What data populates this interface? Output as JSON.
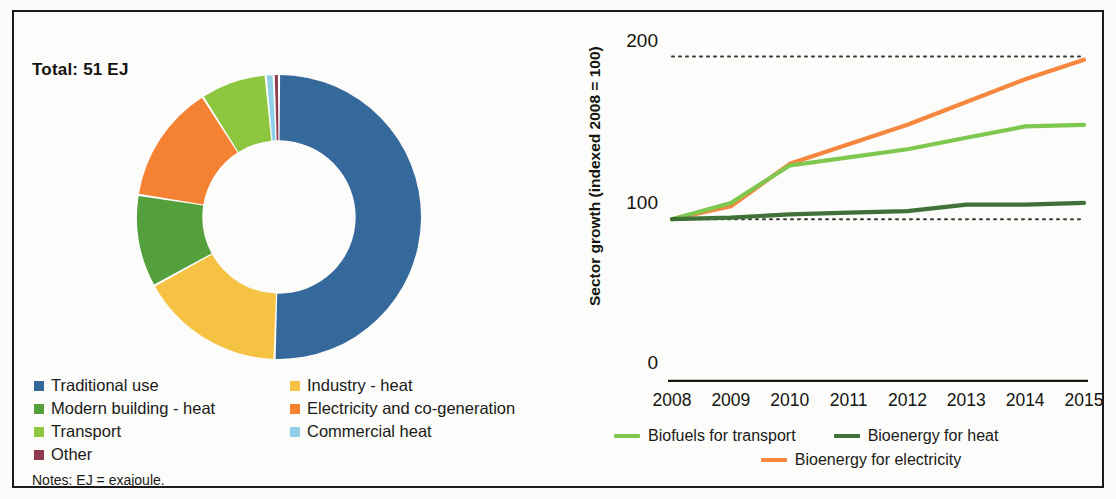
{
  "figure": {
    "notes": "Notes: EJ = exajoule."
  },
  "pie_panel": {
    "total_label": "Total: 51 EJ",
    "legend_left": [
      {
        "label": "Traditional use",
        "color": "#36699b"
      },
      {
        "label": "Modern building - heat",
        "color": "#53a03c"
      },
      {
        "label": "Transport",
        "color": "#8dc63f"
      },
      {
        "label": "Other",
        "color": "#8f3a4e"
      }
    ],
    "legend_right": [
      {
        "label": "Industry - heat",
        "color": "#f6c244"
      },
      {
        "label": "Electricity and co-generation",
        "color": "#f58232"
      },
      {
        "label": "Commercial heat",
        "color": "#8fd0e8"
      }
    ]
  },
  "line_panel": {
    "ylabel": "Sector growth (indexed 2008 = 100)",
    "yticks": [
      "200",
      "100",
      "0"
    ],
    "legend": [
      {
        "label": "Biofuels for transport",
        "color": "#7ec850"
      },
      {
        "label": "Bioenergy for heat",
        "color": "#3f7138"
      },
      {
        "label": "Bioenergy for electricity",
        "color": "#f5873f"
      }
    ]
  },
  "chart_data": [
    {
      "type": "pie",
      "title": "Total: 51 EJ",
      "subtitle": "Bioenergy final energy consumption by sector",
      "total": 51,
      "total_unit": "EJ",
      "legend_position": "bottom",
      "labels": [
        "Traditional use",
        "Industry - heat",
        "Modern building - heat",
        "Electricity and co-generation",
        "Transport",
        "Commercial heat",
        "Other"
      ],
      "values": [
        50.5,
        16.5,
        10.5,
        13.5,
        7.5,
        0.9,
        0.6
      ],
      "value_unit": "percent of total",
      "colors": [
        "#36699b",
        "#f6c244",
        "#53a03c",
        "#f58232",
        "#8dc63f",
        "#8fd0e8",
        "#8f3a4e"
      ],
      "donut": true,
      "inner_radius_fraction": 0.54,
      "start_angle_deg": 0,
      "direction": "clockwise"
    },
    {
      "type": "line",
      "title": "",
      "xlabel": "",
      "ylabel": "Sector growth (indexed 2008 = 100)",
      "x": [
        2008,
        2009,
        2010,
        2011,
        2012,
        2013,
        2014,
        2015
      ],
      "xtick_labels": [
        "2008",
        "2009",
        "2010",
        "2011",
        "2012",
        "2013",
        "2014",
        "2015"
      ],
      "ylim": [
        0,
        215
      ],
      "ytick_values": [
        0,
        100,
        200
      ],
      "ytick_labels": [
        "0",
        "100",
        "200"
      ],
      "grid": "dotted horizontal gridlines at 100 and 200",
      "legend_position": "below axis",
      "series": [
        {
          "name": "Biofuels for transport",
          "color": "#7ec850",
          "values": [
            100,
            110,
            133,
            138,
            143,
            150,
            157,
            158
          ]
        },
        {
          "name": "Bioenergy for heat",
          "color": "#3f7138",
          "values": [
            100,
            101,
            103,
            104,
            105,
            109,
            109,
            110
          ]
        },
        {
          "name": "Bioenergy for electricity",
          "color": "#f5873f",
          "values": [
            100,
            108,
            134,
            146,
            158,
            172,
            186,
            198
          ]
        }
      ]
    }
  ]
}
